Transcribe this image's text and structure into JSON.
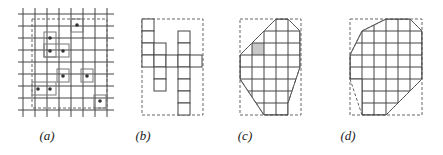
{
  "figure": {
    "panels": [
      {
        "id": "a",
        "label": "(a)",
        "label_x": 45
      },
      {
        "id": "b",
        "label": "(b)",
        "label_x": 143
      },
      {
        "id": "c",
        "label": "(c)",
        "label_x": 245
      },
      {
        "id": "d",
        "label": "(d)",
        "label_x": 348
      }
    ],
    "colors": {
      "line": "#444444",
      "dashed": "#666666",
      "shaded_cell": "#c8c8c8",
      "dot": "#333333"
    },
    "panel_a": {
      "grid_x": [
        23,
        35,
        47,
        59,
        71,
        83,
        95,
        107
      ],
      "grid_y": [
        14,
        26,
        38,
        50,
        62,
        74,
        86,
        98,
        110
      ],
      "grid_extent": {
        "x0": 18,
        "x1": 114,
        "y0": 8,
        "y1": 117
      },
      "dashed_rect": {
        "x": 32,
        "y": 19,
        "w": 75,
        "h": 89
      },
      "points": [
        [
          77,
          25
        ],
        [
          50,
          38
        ],
        [
          50,
          51
        ],
        [
          63,
          51
        ],
        [
          63,
          76
        ],
        [
          87,
          76
        ],
        [
          38,
          89
        ],
        [
          50,
          89
        ],
        [
          100,
          101
        ]
      ],
      "boxes": [
        {
          "x": 71,
          "y": 19,
          "w": 12,
          "h": 13
        },
        {
          "x": 44,
          "y": 32,
          "w": 12,
          "h": 25
        },
        {
          "x": 44,
          "y": 44,
          "w": 25,
          "h": 13
        },
        {
          "x": 57,
          "y": 69,
          "w": 12,
          "h": 13
        },
        {
          "x": 81,
          "y": 69,
          "w": 12,
          "h": 13
        },
        {
          "x": 32,
          "y": 82,
          "w": 24,
          "h": 13
        },
        {
          "x": 94,
          "y": 95,
          "w": 12,
          "h": 13
        }
      ]
    },
    "panel_b": {
      "dashed_rect": {
        "x": 142,
        "y": 19,
        "w": 61,
        "h": 96
      },
      "cells": [
        [
          142,
          19
        ],
        [
          142,
          31
        ],
        [
          142,
          43
        ],
        [
          142,
          55
        ],
        [
          154,
          43
        ],
        [
          154,
          55
        ],
        [
          154,
          67
        ],
        [
          154,
          79
        ],
        [
          166,
          55
        ],
        [
          178,
          31
        ],
        [
          178,
          43
        ],
        [
          178,
          55
        ],
        [
          178,
          67
        ],
        [
          178,
          79
        ],
        [
          178,
          91
        ],
        [
          178,
          103
        ],
        [
          190,
          55
        ]
      ],
      "cell_size": 12
    },
    "panel_c": {
      "dashed_rect": {
        "x": 240,
        "y": 19,
        "w": 61,
        "h": 96
      },
      "shaded_cell": [
        252,
        43
      ],
      "cols": [
        240,
        252,
        264,
        276,
        288,
        300
      ],
      "rows": [
        19,
        31,
        43,
        55,
        67,
        79,
        91,
        103,
        115
      ],
      "hull": [
        [
          276,
          19
        ],
        [
          288,
          19
        ],
        [
          300,
          31
        ],
        [
          300,
          67
        ],
        [
          288,
          103
        ],
        [
          288,
          115
        ],
        [
          264,
          115
        ],
        [
          240,
          79
        ],
        [
          240,
          55
        ],
        [
          252,
          43
        ],
        [
          264,
          31
        ]
      ],
      "dashed_diagonals": [
        [
          [
            240,
            55
          ],
          [
            264,
            31
          ]
        ],
        [
          [
            264,
            31
          ],
          [
            276,
            19
          ]
        ],
        [
          [
            288,
            19
          ],
          [
            300,
            31
          ]
        ],
        [
          [
            300,
            67
          ],
          [
            288,
            103
          ]
        ],
        [
          [
            240,
            79
          ],
          [
            264,
            115
          ]
        ]
      ]
    },
    "panel_d": {
      "dashed_rect": {
        "x": 350,
        "y": 19,
        "w": 72,
        "h": 96
      },
      "cols": [
        350,
        362,
        374,
        386,
        398,
        410,
        422
      ],
      "rows": [
        19,
        31,
        43,
        55,
        67,
        79,
        91,
        103,
        115
      ],
      "hull": [
        [
          386,
          19
        ],
        [
          410,
          19
        ],
        [
          422,
          31
        ],
        [
          422,
          79
        ],
        [
          398,
          103
        ],
        [
          386,
          115
        ],
        [
          362,
          115
        ],
        [
          362,
          79
        ],
        [
          350,
          79
        ],
        [
          350,
          55
        ],
        [
          362,
          31
        ]
      ],
      "dashed_diagonals": [
        [
          [
            350,
            55
          ],
          [
            362,
            31
          ]
        ],
        [
          [
            362,
            31
          ],
          [
            386,
            19
          ]
        ],
        [
          [
            410,
            19
          ],
          [
            422,
            31
          ]
        ],
        [
          [
            422,
            79
          ],
          [
            386,
            115
          ]
        ],
        [
          [
            350,
            79
          ],
          [
            362,
            115
          ]
        ]
      ]
    }
  }
}
